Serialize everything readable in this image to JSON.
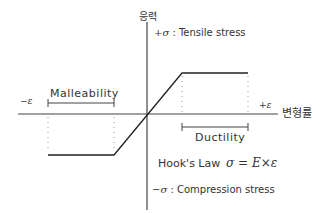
{
  "diagram": {
    "y_axis_label": "응력",
    "x_axis_label": "변형률",
    "positive_stress": {
      "symbol": "+σ",
      "label": ": Tensile stress"
    },
    "negative_stress": {
      "symbol": "−σ",
      "label": ": Compression stress"
    },
    "positive_strain": "+ε",
    "negative_strain": "−ε",
    "malleability_label": "Malleability",
    "ductility_label": "Ductility",
    "hooks_law_label": "Hook's Law",
    "hooks_law_formula": "σ = E×ε",
    "line_color": "#333333"
  }
}
